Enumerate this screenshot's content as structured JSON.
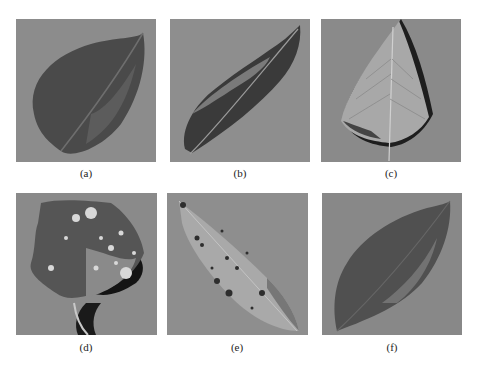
{
  "figure": {
    "panels": [
      {
        "id": "a",
        "caption": "(a)",
        "subject": "dark ovate leaf, healthy"
      },
      {
        "id": "b",
        "caption": "(b)",
        "subject": "narrow lanceolate leaf with dark patches"
      },
      {
        "id": "c",
        "caption": "(c)",
        "subject": "pale heart-shaped leaf with visible veins"
      },
      {
        "id": "d",
        "caption": "(d)",
        "subject": "lobed leaf with white spots and petiole"
      },
      {
        "id": "e",
        "caption": "(e)",
        "subject": "pale lanceolate leaf with dark speckles"
      },
      {
        "id": "f",
        "caption": "(f)",
        "subject": "dark ovate leaf with mottled lesions"
      }
    ],
    "colors": {
      "background": "#8c8c8c",
      "leaf_dark": "#4a4a4a",
      "leaf_light": "#a8a8a8",
      "shadow": "#1e1e1e"
    }
  }
}
